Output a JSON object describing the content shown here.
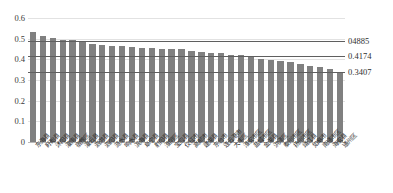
{
  "chart_data": {
    "type": "bar",
    "title": "",
    "subtitle": "",
    "xlabel": "",
    "ylabel": "",
    "ylim": [
      0,
      0.6
    ],
    "ytick_labels": [
      "0.6",
      "0.5",
      "0.4",
      "0.3",
      "0.2",
      "0.1",
      "0"
    ],
    "ytick_values": [
      0.6,
      0.5,
      0.4,
      0.3,
      0.2,
      0.1,
      0
    ],
    "grid": true,
    "legend": "none",
    "bar_color": "#808080",
    "reference_line_color": "#5f5f5f",
    "categories": [
      "东海县",
      "盱眙县",
      "沭阳县",
      "灌南县",
      "宿豫区",
      "灌云县",
      "泗洪县",
      "泗阳县",
      "涟水县",
      "响水县",
      "滨海县",
      "阜宁县",
      "射阳县",
      "淮阴区",
      "宝应县",
      "仪征市",
      "高邮市",
      "建湖县",
      "东台市",
      "连云港市",
      "大丰区",
      "淮安市区",
      "盐城市区",
      "金湖县",
      "洪泽区",
      "泰州市区",
      "扬州市区",
      "靖江县",
      "如皋市",
      "南通市区",
      "海安县",
      "通州区"
    ],
    "values": [
      0.532,
      0.512,
      0.502,
      0.494,
      0.492,
      0.49,
      0.474,
      0.468,
      0.467,
      0.466,
      0.458,
      0.455,
      0.453,
      0.452,
      0.451,
      0.45,
      0.44,
      0.436,
      0.431,
      0.43,
      0.422,
      0.42,
      0.414,
      0.403,
      0.398,
      0.391,
      0.389,
      0.378,
      0.37,
      0.364,
      0.352,
      0.341
    ],
    "reference_lines": [
      {
        "label": "04885",
        "value": 0.4885
      },
      {
        "label": "0.4174",
        "value": 0.4174
      },
      {
        "label": "0.3407",
        "value": 0.3407
      }
    ]
  }
}
